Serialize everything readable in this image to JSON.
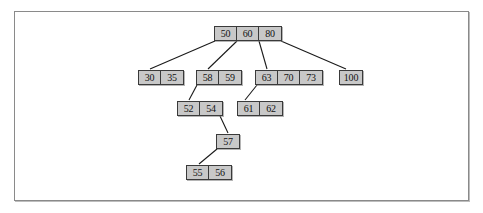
{
  "figure": {
    "frame_color": "#8a8a8a",
    "node_fill": "#c8c8c8",
    "node_border": "#3a3a3a",
    "edge_color": "#1a1a1a",
    "background": "#ffffff"
  },
  "tree": {
    "type": "b-tree",
    "levels": 5,
    "nodes": [
      {
        "id": "root",
        "level": 0,
        "keys": [
          "50",
          "60",
          "80"
        ],
        "x": 214,
        "y": 26
      },
      {
        "id": "n-30-35",
        "level": 1,
        "keys": [
          "30",
          "35"
        ],
        "x": 138,
        "y": 70
      },
      {
        "id": "n-58-59",
        "level": 1,
        "keys": [
          "58",
          "59"
        ],
        "x": 196,
        "y": 70
      },
      {
        "id": "n-63-70-73",
        "level": 1,
        "keys": [
          "63",
          "70",
          "73"
        ],
        "x": 255,
        "y": 70
      },
      {
        "id": "n-100",
        "level": 1,
        "keys": [
          "100"
        ],
        "x": 339,
        "y": 70
      },
      {
        "id": "n-52-54",
        "level": 2,
        "keys": [
          "52",
          "54"
        ],
        "x": 177,
        "y": 101
      },
      {
        "id": "n-61-62",
        "level": 2,
        "keys": [
          "61",
          "62"
        ],
        "x": 237,
        "y": 101
      },
      {
        "id": "n-57",
        "level": 3,
        "keys": [
          "57"
        ],
        "x": 216,
        "y": 134
      },
      {
        "id": "n-55-56",
        "level": 4,
        "keys": [
          "55",
          "56"
        ],
        "x": 186,
        "y": 165
      }
    ],
    "edges": [
      {
        "from": "root",
        "to": "n-30-35",
        "x1": 215,
        "y1": 41,
        "x2": 150,
        "y2": 69
      },
      {
        "from": "root",
        "to": "n-58-59",
        "x1": 237,
        "y1": 41,
        "x2": 208,
        "y2": 69
      },
      {
        "from": "root",
        "to": "n-63-70-73",
        "x1": 259,
        "y1": 41,
        "x2": 267,
        "y2": 69
      },
      {
        "from": "root",
        "to": "n-100",
        "x1": 281,
        "y1": 41,
        "x2": 346,
        "y2": 69
      },
      {
        "from": "n-58-59",
        "to": "n-52-54",
        "x1": 197,
        "y1": 85,
        "x2": 189,
        "y2": 100
      },
      {
        "from": "n-63-70-73",
        "to": "n-61-62",
        "x1": 257,
        "y1": 85,
        "x2": 245,
        "y2": 100
      },
      {
        "from": "n-52-54",
        "to": "n-57",
        "x1": 220,
        "y1": 116,
        "x2": 228,
        "y2": 133
      },
      {
        "from": "n-57",
        "to": "n-55-56",
        "x1": 217,
        "y1": 149,
        "x2": 199,
        "y2": 164
      }
    ]
  }
}
